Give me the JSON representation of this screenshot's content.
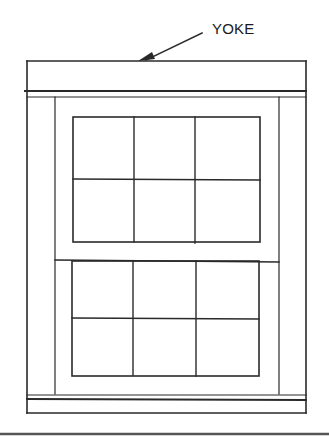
{
  "diagram": {
    "callouts": [
      {
        "label": "YOKE",
        "target": "yoke"
      }
    ],
    "components": {
      "yoke": "head jamb at top of frame",
      "upper_sash": {
        "lites": 6,
        "rows": 2,
        "cols": 3
      },
      "lower_sash": {
        "lites": 6,
        "rows": 2,
        "cols": 3
      },
      "sill": "bottom of frame"
    },
    "colors": {
      "line": "#2a2a2a",
      "background": "#ffffff",
      "rule": "#555555"
    }
  }
}
